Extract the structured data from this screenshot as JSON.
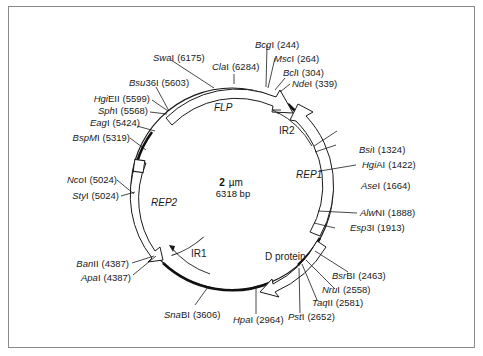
{
  "plasmid": {
    "name": "2 µm",
    "name_parts": {
      "num": "2",
      "unit": "µm"
    },
    "size_label": "6318 bp",
    "total_bp": 6318
  },
  "features": [
    {
      "name": "FLP",
      "italic": true
    },
    {
      "name": "REP1",
      "italic": true
    },
    {
      "name": "REP2",
      "italic": true
    },
    {
      "name": "IR1",
      "italic": false
    },
    {
      "name": "IR2",
      "italic": false
    },
    {
      "name": "D protein",
      "italic": false
    }
  ],
  "sites": [
    {
      "enzyme_italic": "Bcg",
      "enzyme_rest": "I",
      "position": "(244)"
    },
    {
      "enzyme_italic": "Msc",
      "enzyme_rest": "I",
      "position": "(264)"
    },
    {
      "enzyme_italic": "Bcl",
      "enzyme_rest": "I",
      "position": "(304)"
    },
    {
      "enzyme_italic": "Nde",
      "enzyme_rest": "I",
      "position": "(339)"
    },
    {
      "enzyme_italic": "Bsi",
      "enzyme_rest": "I",
      "position": "(1324)"
    },
    {
      "enzyme_italic": "Hgi",
      "enzyme_rest": "AI",
      "position": "(1422)"
    },
    {
      "enzyme_italic": "Ase",
      "enzyme_rest": "I",
      "position": "(1664)"
    },
    {
      "enzyme_italic": "Alw",
      "enzyme_rest": "NI",
      "position": "(1888)"
    },
    {
      "enzyme_italic": "Esp",
      "enzyme_rest": "3I",
      "position": "(1913)"
    },
    {
      "enzyme_italic": "Bsr",
      "enzyme_rest": "BI",
      "position": "(2463)"
    },
    {
      "enzyme_italic": "Nru",
      "enzyme_rest": "I",
      "position": "(2558)"
    },
    {
      "enzyme_italic": "Taq",
      "enzyme_rest": "II",
      "position": "(2581)"
    },
    {
      "enzyme_italic": "Pst",
      "enzyme_rest": "I",
      "position": "(2652)"
    },
    {
      "enzyme_italic": "Hpa",
      "enzyme_rest": "I",
      "position": "(2964)"
    },
    {
      "enzyme_italic": "Sna",
      "enzyme_rest": "BI",
      "position": "(3606)"
    },
    {
      "enzyme_italic": "Ban",
      "enzyme_rest": "II",
      "position": "(4387)"
    },
    {
      "enzyme_italic": "Apa",
      "enzyme_rest": "I",
      "position": "(4387)"
    },
    {
      "enzyme_italic": "Sty",
      "enzyme_rest": "I",
      "position": "(5024)"
    },
    {
      "enzyme_italic": "Nco",
      "enzyme_rest": "I",
      "position": "(5024)"
    },
    {
      "enzyme_italic": "BspM",
      "enzyme_rest": "I",
      "position": "(5319)"
    },
    {
      "enzyme_italic": "Eag",
      "enzyme_rest": "I",
      "position": "(5424)"
    },
    {
      "enzyme_italic": "Sph",
      "enzyme_rest": "I",
      "position": "(5568)"
    },
    {
      "enzyme_italic": "Hgi",
      "enzyme_rest": "EII",
      "position": "(5599)"
    },
    {
      "enzyme_italic": "Bsu",
      "enzyme_rest": "36I",
      "position": "(5603)"
    },
    {
      "enzyme_italic": "Swa",
      "enzyme_rest": "I",
      "position": "(6175)"
    },
    {
      "enzyme_italic": "Cla",
      "enzyme_rest": "I",
      "position": "(6284)"
    }
  ],
  "colors": {
    "line": "#1a1a1a",
    "frame": "#8a8a8a",
    "background": "#ffffff"
  }
}
